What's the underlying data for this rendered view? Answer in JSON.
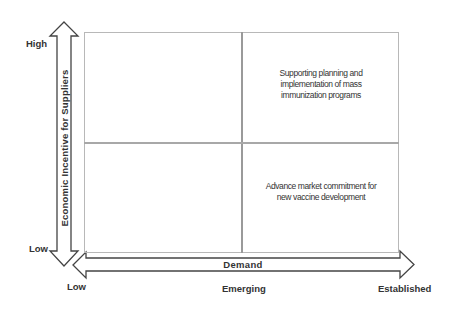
{
  "diagram": {
    "type": "2x2 matrix",
    "y_axis": {
      "title": "Economic Incentive for Suppliers",
      "high_label": "High",
      "low_label": "Low"
    },
    "x_axis": {
      "title": "Demand",
      "low_label": "Low",
      "mid_label": "Emerging",
      "high_label": "Established"
    },
    "quadrants": {
      "top_left": "",
      "top_right": "Supporting planning and implementation of mass immunization programs",
      "bottom_left": "",
      "bottom_right": "Advance market commitment for new vaccine development"
    },
    "colors": {
      "arrow_stroke": "#444444",
      "grid_line": "#b8b8b8",
      "text": "#333333"
    }
  }
}
